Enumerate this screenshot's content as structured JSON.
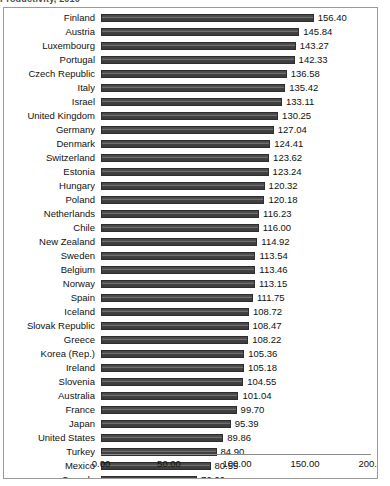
{
  "caption": {
    "text": "Productivity, 2010"
  },
  "chart_data": {
    "type": "bar",
    "orientation": "horizontal",
    "title": "",
    "xlabel": "",
    "ylabel": "",
    "xlim": [
      0,
      200
    ],
    "xticks": [
      "0.00",
      "50.00",
      "100.00",
      "150.00",
      "200.00"
    ],
    "xtick_values": [
      0,
      50,
      100,
      150,
      200
    ],
    "grid": false,
    "legend": "none",
    "bar_color": "#454545",
    "value_label_format": "0.00",
    "categories": [
      "Finland",
      "Austria",
      "Luxembourg",
      "Portugal",
      "Czech Republic",
      "Italy",
      "Israel",
      "United Kingdom",
      "Germany",
      "Denmark",
      "Switzerland",
      "Estonia",
      "Hungary",
      "Poland",
      "Netherlands",
      "Chile",
      "New Zealand",
      "Sweden",
      "Belgium",
      "Norway",
      "Spain",
      "Iceland",
      "Slovak Republic",
      "Greece",
      "Korea (Rep.)",
      "Ireland",
      "Slovenia",
      "Australia",
      "France",
      "Japan",
      "United States",
      "Turkey",
      "Mexico",
      "Canada"
    ],
    "values": [
      156.4,
      145.84,
      143.27,
      142.33,
      136.58,
      135.42,
      133.11,
      130.25,
      127.04,
      124.41,
      123.62,
      123.24,
      120.32,
      120.18,
      116.23,
      116.0,
      114.92,
      113.54,
      113.46,
      113.15,
      111.75,
      108.72,
      108.47,
      108.22,
      105.36,
      105.18,
      104.55,
      101.04,
      99.7,
      95.39,
      89.86,
      84.9,
      80.55,
      70.66
    ],
    "value_labels": [
      "156.40",
      "145.84",
      "143.27",
      "142.33",
      "136.58",
      "135.42",
      "133.11",
      "130.25",
      "127.04",
      "124.41",
      "123.62",
      "123.24",
      "120.32",
      "120.18",
      "116.23",
      "116.00",
      "114.92",
      "113.54",
      "113.46",
      "113.15",
      "111.75",
      "108.72",
      "108.47",
      "108.22",
      "105.36",
      "105.18",
      "104.55",
      "101.04",
      "99.70",
      "95.39",
      "89.86",
      "84.90",
      "80.55",
      "70.66"
    ]
  }
}
